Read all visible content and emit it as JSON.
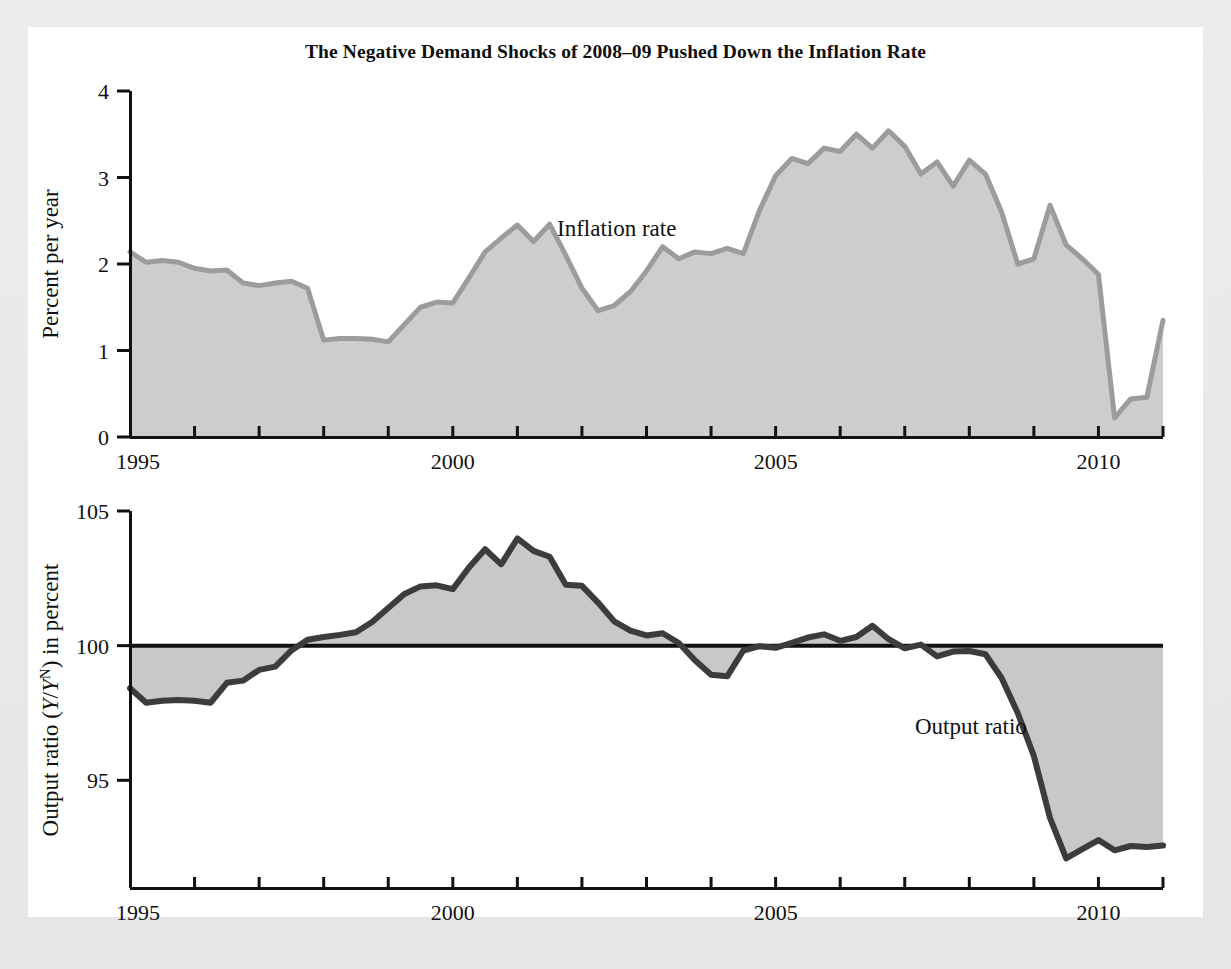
{
  "figure": {
    "title": "The Negative Demand Shocks of 2008–09 Pushed Down the Inflation Rate",
    "background_color": "#ffffff",
    "page_color": "#ececec"
  },
  "chart_data": [
    {
      "type": "area",
      "id": "inflation-panel",
      "title": "",
      "series_label": "Inflation rate",
      "xlabel": "",
      "ylabel": "Percent per year",
      "xlim": [
        1995.0,
        2011.0
      ],
      "ylim": [
        0,
        4
      ],
      "yticks": [
        0,
        1,
        2,
        3,
        4
      ],
      "ytick_labels": [
        "0",
        "1",
        "2",
        "3",
        "4"
      ],
      "xticks": [
        1995,
        1996,
        1997,
        1998,
        1999,
        2000,
        2001,
        2002,
        2003,
        2004,
        2005,
        2006,
        2007,
        2008,
        2009,
        2010,
        2011
      ],
      "xtick_labels_shown": [
        "1995",
        "2000",
        "2005",
        "2010"
      ],
      "xtick_labels_at": [
        1995,
        2000,
        2005,
        2010
      ],
      "grid": false,
      "legend": "inline-annotation",
      "fill_color": "#cccccc",
      "line_color": "#9a9a9a",
      "x": [
        1995.0,
        1995.25,
        1995.5,
        1995.75,
        1996.0,
        1996.25,
        1996.5,
        1996.75,
        1997.0,
        1997.25,
        1997.5,
        1997.75,
        1998.0,
        1998.25,
        1998.5,
        1998.75,
        1999.0,
        1999.25,
        1999.5,
        1999.75,
        2000.0,
        2000.25,
        2000.5,
        2000.75,
        2001.0,
        2001.25,
        2001.5,
        2001.75,
        2002.0,
        2002.25,
        2002.5,
        2002.75,
        2003.0,
        2003.25,
        2003.5,
        2003.75,
        2004.0,
        2004.25,
        2004.5,
        2004.75,
        2005.0,
        2005.25,
        2005.5,
        2005.75,
        2006.0,
        2006.25,
        2006.5,
        2006.75,
        2007.0,
        2007.25,
        2007.5,
        2007.75,
        2008.0,
        2008.25,
        2008.5,
        2008.75,
        2009.0,
        2009.25,
        2009.5,
        2009.75,
        2010.0,
        2010.25,
        2010.5,
        2010.75,
        2011.0
      ],
      "values": [
        2.14,
        2.02,
        2.04,
        2.02,
        1.95,
        1.92,
        1.93,
        1.78,
        1.75,
        1.78,
        1.8,
        1.72,
        1.12,
        1.14,
        1.14,
        1.13,
        1.1,
        1.3,
        1.5,
        1.56,
        1.55,
        1.84,
        2.14,
        2.3,
        2.45,
        2.26,
        2.46,
        2.1,
        1.72,
        1.46,
        1.52,
        1.68,
        1.92,
        2.2,
        2.06,
        2.14,
        2.12,
        2.18,
        2.12,
        2.62,
        3.02,
        3.22,
        3.16,
        3.34,
        3.3,
        3.5,
        3.34,
        3.54,
        3.36,
        3.04,
        3.18,
        2.9,
        3.2,
        3.04,
        2.6,
        2.0,
        2.06,
        2.68,
        2.22,
        2.06,
        1.88,
        0.22,
        0.44,
        0.46,
        1.35
      ]
    },
    {
      "type": "area",
      "id": "output-ratio-panel",
      "title": "",
      "series_label": "Output ratio",
      "xlabel": "",
      "ylabel": "Output ratio (Y/Y^N) in percent",
      "ylabel_parts": {
        "prefix": "Output ratio (",
        "italic_y1": "Y",
        "slash": "/",
        "italic_y2": "Y",
        "superscript": "N",
        "suffix": ") in percent"
      },
      "xlim": [
        1995.0,
        2011.0
      ],
      "ylim": [
        91.0,
        105.0
      ],
      "yticks": [
        95,
        100,
        105
      ],
      "ytick_labels": [
        "95",
        "100",
        "105"
      ],
      "xticks": [
        1995,
        1996,
        1997,
        1998,
        1999,
        2000,
        2001,
        2002,
        2003,
        2004,
        2005,
        2006,
        2007,
        2008,
        2009,
        2010,
        2011
      ],
      "xtick_labels_shown": [
        "1995",
        "2000",
        "2005",
        "2010"
      ],
      "xtick_labels_at": [
        1995,
        2000,
        2005,
        2010
      ],
      "reference_line": 100,
      "grid": false,
      "legend": "inline-annotation",
      "fill_color": "#c9c9c9",
      "line_color": "#3a3a3a",
      "x": [
        1995.0,
        1995.25,
        1995.5,
        1995.75,
        1996.0,
        1996.25,
        1996.5,
        1996.75,
        1997.0,
        1997.25,
        1997.5,
        1997.75,
        1998.0,
        1998.25,
        1998.5,
        1998.75,
        1999.0,
        1999.25,
        1999.5,
        1999.75,
        2000.0,
        2000.25,
        2000.5,
        2000.75,
        2001.0,
        2001.25,
        2001.5,
        2001.75,
        2002.0,
        2002.25,
        2002.5,
        2002.75,
        2003.0,
        2003.25,
        2003.5,
        2003.75,
        2004.0,
        2004.25,
        2004.5,
        2004.75,
        2005.0,
        2005.25,
        2005.5,
        2005.75,
        2006.0,
        2006.25,
        2006.5,
        2006.75,
        2007.0,
        2007.25,
        2007.5,
        2007.75,
        2008.0,
        2008.25,
        2008.5,
        2008.75,
        2009.0,
        2009.25,
        2009.5,
        2009.75,
        2010.0,
        2010.25,
        2010.5,
        2010.75,
        2011.0
      ],
      "values": [
        98.42,
        97.88,
        97.95,
        97.98,
        97.95,
        97.88,
        98.62,
        98.7,
        99.1,
        99.22,
        99.82,
        100.22,
        100.32,
        100.4,
        100.5,
        100.88,
        101.4,
        101.92,
        102.2,
        102.24,
        102.1,
        102.9,
        103.58,
        103.02,
        103.98,
        103.52,
        103.3,
        102.26,
        102.22,
        101.6,
        100.9,
        100.56,
        100.38,
        100.46,
        100.1,
        99.46,
        98.92,
        98.86,
        99.82,
        99.98,
        99.92,
        100.1,
        100.3,
        100.42,
        100.18,
        100.32,
        100.74,
        100.24,
        99.9,
        100.04,
        99.6,
        99.78,
        99.8,
        99.68,
        98.8,
        97.5,
        95.9,
        93.6,
        92.1,
        92.44,
        92.78,
        92.4,
        92.56,
        92.52,
        92.58
      ]
    }
  ]
}
